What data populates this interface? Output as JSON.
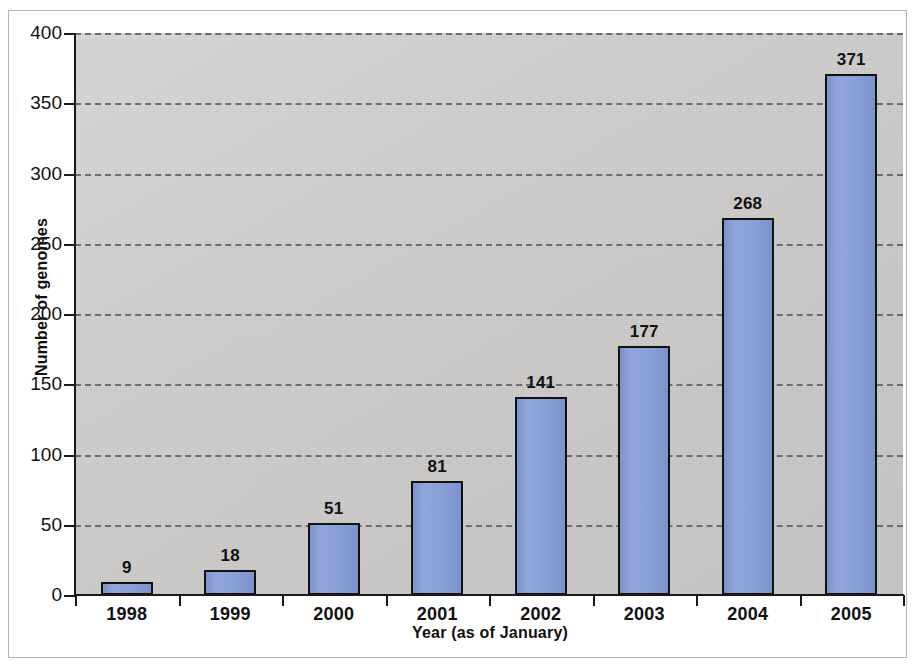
{
  "chart_data": {
    "type": "bar",
    "title": "",
    "subtitle": "",
    "xlabel": "Year (as of January)",
    "ylabel": "Number of genomes",
    "categories": [
      "1998",
      "1999",
      "2000",
      "2001",
      "2002",
      "2003",
      "2004",
      "2005"
    ],
    "values": [
      9,
      18,
      51,
      81,
      141,
      177,
      268,
      371
    ],
    "value_labels": [
      "9",
      "18",
      "51",
      "81",
      "141",
      "177",
      "268",
      "371"
    ],
    "series": [
      {
        "name": "Number of genomes",
        "values": [
          9,
          18,
          51,
          81,
          141,
          177,
          268,
          371
        ]
      }
    ],
    "ylim": [
      0,
      400
    ],
    "ytick_values": [
      0,
      50,
      100,
      150,
      200,
      250,
      300,
      350,
      400
    ],
    "ytick_labels": [
      "0",
      "50",
      "100",
      "150",
      "200",
      "250",
      "300",
      "350",
      "400"
    ],
    "grid": true,
    "grid_axis": "y",
    "grid_style": "dashed",
    "legend": false,
    "legend_position": "none",
    "bar_fill_color": "#89a0d6",
    "bar_border_color": "#111111",
    "plot_background_color": "#cbcac8",
    "gridline_color": "#6d6d6d",
    "axis_color": "#1a1a1a",
    "text_color": "#111111",
    "frame_color": "#b6b6b6",
    "page_background_color": "#ffffff"
  }
}
